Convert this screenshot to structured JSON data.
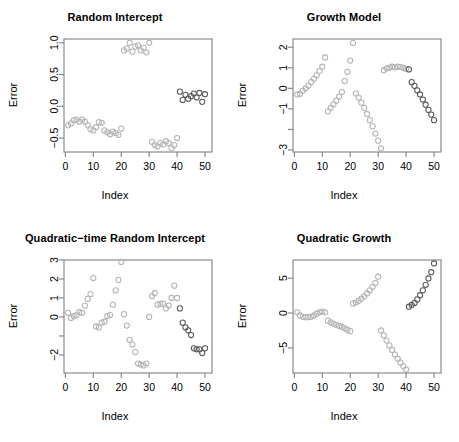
{
  "figure": {
    "axis_x_label": "Index",
    "axis_y_label": "Error",
    "point_symbol": "open-circle",
    "frame_color": "#808080",
    "background": "#ffffff"
  },
  "chart_data": [
    {
      "type": "scatter",
      "title": "Random Intercept",
      "xlabel": "Index",
      "ylabel": "Error",
      "xlim": [
        -0.5,
        52.5
      ],
      "ylim": [
        -0.72,
        1.06
      ],
      "xticks": [
        0,
        10,
        20,
        30,
        40,
        50
      ],
      "yticks": [
        -0.5,
        0.0,
        0.5,
        1.0
      ],
      "ytick_labels": [
        "-0.5",
        "0.0",
        "0.5",
        "1.0"
      ],
      "grid": false,
      "legend": "none",
      "x": [
        1,
        2,
        3,
        4,
        5,
        6,
        7,
        8,
        9,
        10,
        11,
        12,
        13,
        14,
        15,
        16,
        17,
        18,
        19,
        20,
        21,
        22,
        23,
        24,
        25,
        26,
        27,
        28,
        29,
        30,
        31,
        32,
        33,
        34,
        35,
        36,
        37,
        38,
        39,
        40,
        41,
        42,
        43,
        44,
        45,
        46,
        47,
        48,
        49,
        50
      ],
      "y": [
        -0.3,
        -0.27,
        -0.22,
        -0.21,
        -0.24,
        -0.21,
        -0.24,
        -0.3,
        -0.36,
        -0.38,
        -0.33,
        -0.25,
        -0.26,
        -0.38,
        -0.41,
        -0.44,
        -0.4,
        -0.42,
        -0.45,
        -0.35,
        0.88,
        0.91,
        1.0,
        0.86,
        0.94,
        0.96,
        0.88,
        0.92,
        0.85,
        1.0,
        -0.56,
        -0.61,
        -0.63,
        -0.58,
        -0.6,
        -0.55,
        -0.58,
        -0.66,
        -0.61,
        -0.5,
        0.23,
        0.1,
        0.18,
        0.12,
        0.16,
        0.2,
        0.14,
        0.21,
        0.07,
        0.19
      ],
      "colors": [
        "g",
        "g",
        "g",
        "g",
        "g",
        "g",
        "g",
        "g",
        "g",
        "g",
        "g",
        "g",
        "g",
        "g",
        "g",
        "g",
        "g",
        "g",
        "g",
        "g",
        "g",
        "g",
        "g",
        "g",
        "g",
        "g",
        "g",
        "g",
        "g",
        "g",
        "g",
        "g",
        "g",
        "g",
        "g",
        "g",
        "g",
        "g",
        "g",
        "g",
        "d",
        "d",
        "d",
        "d",
        "d",
        "d",
        "d",
        "d",
        "d",
        "d"
      ]
    },
    {
      "type": "scatter",
      "title": "Growth Model",
      "xlabel": "Index",
      "ylabel": "Error",
      "xlim": [
        -0.5,
        52.5
      ],
      "ylim": [
        -3.1,
        2.4
      ],
      "xticks": [
        0,
        10,
        20,
        30,
        40,
        50
      ],
      "yticks": [
        -3,
        -2,
        -1,
        0,
        1,
        2
      ],
      "ytick_labels": [
        "-3",
        "",
        "-1",
        "0",
        "1",
        "2"
      ],
      "grid": false,
      "legend": "none",
      "x": [
        1,
        2,
        3,
        4,
        5,
        6,
        7,
        8,
        9,
        10,
        11,
        12,
        13,
        14,
        15,
        16,
        17,
        18,
        19,
        20,
        21,
        22,
        23,
        24,
        25,
        26,
        27,
        28,
        29,
        30,
        31,
        32,
        33,
        34,
        35,
        36,
        37,
        38,
        39,
        40,
        41,
        42,
        43,
        44,
        45,
        46,
        47,
        48,
        49,
        50
      ],
      "y": [
        -0.3,
        -0.27,
        -0.12,
        0.0,
        0.13,
        0.31,
        0.46,
        0.63,
        0.84,
        1.05,
        1.5,
        -1.12,
        -0.95,
        -0.78,
        -0.6,
        -0.4,
        -0.18,
        0.35,
        0.8,
        1.35,
        2.2,
        -0.25,
        -0.45,
        -0.7,
        -0.95,
        -1.25,
        -1.55,
        -1.85,
        -2.2,
        -2.55,
        -2.92,
        0.88,
        0.96,
        1.0,
        1.05,
        1.02,
        1.06,
        1.04,
        1.0,
        0.95,
        0.92,
        0.3,
        0.12,
        -0.1,
        -0.3,
        -0.55,
        -0.8,
        -1.05,
        -1.28,
        -1.55,
        -1.62
      ],
      "colors": [
        "g",
        "g",
        "g",
        "g",
        "g",
        "g",
        "g",
        "g",
        "g",
        "g",
        "g",
        "g",
        "g",
        "g",
        "g",
        "g",
        "g",
        "g",
        "g",
        "g",
        "g",
        "g",
        "g",
        "g",
        "g",
        "g",
        "g",
        "g",
        "g",
        "g",
        "g",
        "g",
        "g",
        "g",
        "g",
        "g",
        "g",
        "g",
        "g",
        "g",
        "d",
        "d",
        "d",
        "d",
        "d",
        "d",
        "d",
        "d",
        "d",
        "d"
      ]
    },
    {
      "type": "scatter",
      "title": "Quadratic−time Random Intercept",
      "xlabel": "Index",
      "ylabel": "Error",
      "xlim": [
        -0.5,
        52.5
      ],
      "ylim": [
        -2.95,
        3.0
      ],
      "xticks": [
        0,
        10,
        20,
        30,
        40,
        50
      ],
      "yticks": [
        -2,
        -1,
        0,
        1,
        2,
        3
      ],
      "ytick_labels": [
        "-2",
        "",
        "0",
        "1",
        "2",
        "3"
      ],
      "grid": false,
      "legend": "none",
      "x": [
        1,
        2,
        3,
        4,
        5,
        6,
        7,
        8,
        9,
        10,
        11,
        12,
        13,
        14,
        15,
        16,
        17,
        18,
        19,
        20,
        21,
        22,
        23,
        24,
        25,
        26,
        27,
        28,
        29,
        30,
        31,
        32,
        33,
        34,
        35,
        36,
        37,
        38,
        39,
        40,
        41,
        42,
        43,
        44,
        45,
        46,
        47,
        48,
        49,
        50
      ],
      "y": [
        0.22,
        -0.05,
        0.05,
        0.1,
        0.25,
        0.22,
        0.6,
        0.95,
        1.2,
        2.05,
        -0.5,
        -0.55,
        -0.3,
        -0.25,
        0.05,
        0.1,
        0.65,
        1.4,
        1.95,
        2.9,
        0.15,
        -0.45,
        -1.2,
        -1.45,
        -1.85,
        -2.45,
        -2.5,
        -2.55,
        -2.45,
        0.0,
        1.1,
        1.25,
        0.65,
        0.7,
        0.7,
        0.45,
        0.6,
        1.0,
        1.65,
        1.0,
        0.45,
        -0.3,
        -0.55,
        -0.7,
        -0.95,
        -1.65,
        -1.7,
        -1.7,
        -1.9,
        -1.65
      ],
      "colors": [
        "g",
        "g",
        "g",
        "g",
        "g",
        "g",
        "g",
        "g",
        "g",
        "g",
        "g",
        "g",
        "g",
        "g",
        "g",
        "g",
        "g",
        "g",
        "g",
        "g",
        "g",
        "g",
        "g",
        "g",
        "g",
        "g",
        "g",
        "g",
        "g",
        "g",
        "g",
        "g",
        "g",
        "g",
        "g",
        "g",
        "g",
        "g",
        "g",
        "g",
        "d",
        "d",
        "d",
        "d",
        "d",
        "d",
        "d",
        "d",
        "d",
        "d"
      ]
    },
    {
      "type": "scatter",
      "title": "Quadratic Growth",
      "xlabel": "Index",
      "ylabel": "Error",
      "xlim": [
        -0.5,
        52.5
      ],
      "ylim": [
        -8.6,
        7.6
      ],
      "xticks": [
        0,
        10,
        20,
        30,
        40,
        50
      ],
      "yticks": [
        -5,
        0,
        5
      ],
      "ytick_labels": [
        "-5",
        "0",
        "5"
      ],
      "grid": false,
      "legend": "none",
      "x": [
        1,
        2,
        3,
        4,
        5,
        6,
        7,
        8,
        9,
        10,
        11,
        12,
        13,
        14,
        15,
        16,
        17,
        18,
        19,
        20,
        21,
        22,
        23,
        24,
        25,
        26,
        27,
        28,
        29,
        30,
        31,
        32,
        33,
        34,
        35,
        36,
        37,
        38,
        39,
        40,
        41,
        42,
        43,
        44,
        45,
        46,
        47,
        48,
        49,
        50
      ],
      "y": [
        0.1,
        -0.35,
        -0.55,
        -0.6,
        -0.6,
        -0.55,
        -0.35,
        -0.1,
        0.1,
        0.2,
        0.1,
        -1.1,
        -1.35,
        -1.55,
        -1.7,
        -1.85,
        -2.0,
        -2.2,
        -2.4,
        -2.6,
        1.35,
        1.5,
        1.75,
        2.05,
        2.4,
        2.8,
        3.25,
        3.75,
        4.3,
        5.2,
        -2.5,
        -3.2,
        -3.95,
        -4.65,
        -5.3,
        -5.95,
        -6.55,
        -7.1,
        -7.65,
        -8.1,
        0.9,
        1.15,
        1.45,
        1.95,
        2.55,
        3.25,
        4.05,
        4.95,
        5.85,
        7.1
      ],
      "colors": [
        "g",
        "g",
        "g",
        "g",
        "g",
        "g",
        "g",
        "g",
        "g",
        "g",
        "g",
        "g",
        "g",
        "g",
        "g",
        "g",
        "g",
        "g",
        "g",
        "g",
        "g",
        "g",
        "g",
        "g",
        "g",
        "g",
        "g",
        "g",
        "g",
        "g",
        "g",
        "g",
        "g",
        "g",
        "g",
        "g",
        "g",
        "g",
        "g",
        "g",
        "d",
        "d",
        "d",
        "d",
        "d",
        "d",
        "d",
        "d",
        "d",
        "d"
      ]
    }
  ],
  "panels": [
    {
      "name": "random-intercept",
      "title": "Random Intercept"
    },
    {
      "name": "growth-model",
      "title": "Growth Model"
    },
    {
      "name": "quadratic-time-random-intercept",
      "title": "Quadratic−time Random Intercept"
    },
    {
      "name": "quadratic-growth",
      "title": "Quadratic Growth"
    }
  ]
}
